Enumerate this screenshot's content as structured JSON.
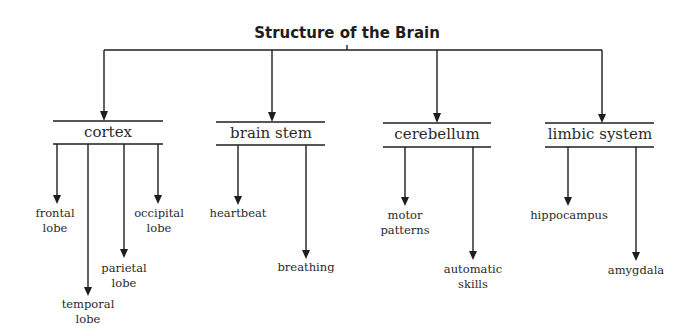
{
  "title": "Structure of the Brain",
  "categories": [
    {
      "label": "cortex",
      "children": [
        {
          "label": "frontal\nlobe"
        },
        {
          "label": "temporal\nlobe"
        },
        {
          "label": "parietal\nlobe"
        },
        {
          "label": "occipital\nlobe"
        }
      ]
    },
    {
      "label": "brain stem",
      "children": [
        {
          "label": "heartbeat"
        },
        {
          "label": "breathing"
        }
      ]
    },
    {
      "label": "cerebellum",
      "children": [
        {
          "label": "motor\npatterns"
        },
        {
          "label": "automatic\nskills"
        }
      ]
    },
    {
      "label": "limbic system",
      "children": [
        {
          "label": "hippocampus"
        },
        {
          "label": "amygdala"
        }
      ]
    }
  ],
  "colors": {
    "line": "#1e1e1e",
    "text": "#2a2a2a"
  }
}
